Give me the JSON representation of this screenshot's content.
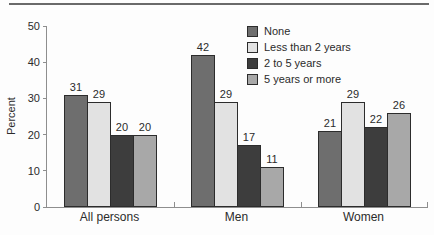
{
  "chart_data": {
    "type": "bar",
    "title": "",
    "xlabel": "",
    "ylabel": "Percent",
    "ylim": [
      0,
      50
    ],
    "yticks": [
      0,
      10,
      20,
      30,
      40,
      50
    ],
    "categories": [
      "All persons",
      "Men",
      "Women"
    ],
    "series": [
      {
        "name": "None",
        "color": "#6e6e6e",
        "values": [
          31,
          42,
          21
        ]
      },
      {
        "name": "Less than 2 years",
        "color": "#e2e2e2",
        "values": [
          29,
          29,
          29
        ]
      },
      {
        "name": "2 to 5 years",
        "color": "#3d3d3d",
        "values": [
          20,
          17,
          22
        ]
      },
      {
        "name": "5 years or more",
        "color": "#a8a8a8",
        "values": [
          20,
          11,
          26
        ]
      }
    ],
    "legend_position": "top-right-inside",
    "grid": false,
    "bar_outline_color": "#2c2c2c",
    "axis_color": "#8e8e8e",
    "top_rule_color": "#6a6a6a"
  }
}
